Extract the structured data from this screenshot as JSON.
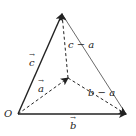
{
  "diagram": {
    "type": "vector-tetrahedron-projection",
    "points": {
      "O": {
        "label": "O",
        "x": 18,
        "y": 114
      },
      "C": {
        "x": 62,
        "y": 14
      },
      "B": {
        "x": 126,
        "y": 114
      },
      "A": {
        "x": 68,
        "y": 78
      }
    },
    "edges": [
      {
        "from": "O",
        "to": "C",
        "style": "solid",
        "arrow": true,
        "label": "c"
      },
      {
        "from": "O",
        "to": "B",
        "style": "solid",
        "arrow": true,
        "label": "b"
      },
      {
        "from": "C",
        "to": "B",
        "style": "solid-thin",
        "arrow": false,
        "label": ""
      },
      {
        "from": "O",
        "to": "A",
        "style": "dashed",
        "arrow": true,
        "label": "a"
      },
      {
        "from": "A",
        "to": "C",
        "style": "dashed",
        "arrow": true,
        "label": "c − a"
      },
      {
        "from": "A",
        "to": "B",
        "style": "dashed",
        "arrow": true,
        "label": "b − a"
      }
    ],
    "labels": {
      "origin": "O",
      "c": "c",
      "c_minus_a": "c − a",
      "a": "a",
      "b_minus_a": "b − a",
      "b": "b"
    },
    "colors": {
      "stroke": "#222222",
      "background": "#ffffff"
    }
  }
}
